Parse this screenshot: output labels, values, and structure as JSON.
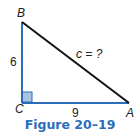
{
  "figure": {
    "caption": "Figure 20–19",
    "caption_color": "#2a6ebb",
    "vertices": {
      "A": "A",
      "B": "B",
      "C": "C"
    },
    "sides": {
      "BC": "6",
      "CA": "9",
      "AB": "c = ?"
    },
    "colors": {
      "legs": "#2a6ebb",
      "hypotenuse": "#111111",
      "right_angle_fill": "#a9c4e4"
    }
  }
}
